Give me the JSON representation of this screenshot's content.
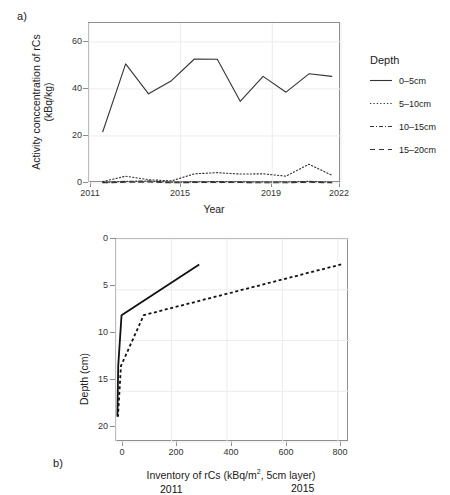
{
  "figure": {
    "background": "#ffffff",
    "line_color": "#333333",
    "grid_color": "#ececec",
    "frame_color": "#8d8d8d"
  },
  "panel_a": {
    "letter": "a)",
    "xlabel": "Year",
    "ylabel_line1": "Activity conccentration of rCs",
    "ylabel_line2": "(kBq/kg)",
    "xticks": [
      "2011",
      "2015",
      "2019",
      "2022"
    ],
    "yticks": [
      "0",
      "20",
      "40",
      "60"
    ],
    "legend": {
      "title": "Depth",
      "items": [
        {
          "label": "0–5cm",
          "style": "solid"
        },
        {
          "label": "5–10cm",
          "style": "dotted"
        },
        {
          "label": "10–15cm",
          "style": "dashdot"
        },
        {
          "label": "15–20cm",
          "style": "dashed"
        }
      ]
    }
  },
  "panel_b": {
    "letter": "b)",
    "xlabel_main": "Inventory of rCs (kBq/m",
    "xlabel_sup": "2",
    "xlabel_tail": ", 5cm layer)",
    "ylabel": "Depth (cm)",
    "xticks": [
      "0",
      "200",
      "400",
      "600",
      "800"
    ],
    "yticks": [
      "0",
      "5",
      "10",
      "15",
      "20"
    ],
    "annotations": [
      {
        "label": "2011"
      },
      {
        "label": "2015"
      }
    ]
  },
  "chart_data": [
    {
      "type": "line",
      "title": "",
      "panel": "a",
      "xlabel": "Year",
      "ylabel": "Activity conccentration of rCs (kBq/kg)",
      "xlim": [
        2011,
        2022
      ],
      "ylim": [
        0,
        68
      ],
      "xticks": [
        2011,
        2015,
        2019,
        2022
      ],
      "yticks": [
        0,
        20,
        40,
        60
      ],
      "grid": true,
      "legend_position": "right",
      "legend_title": "Depth",
      "x": [
        2011.6,
        2012.6,
        2013.6,
        2014.6,
        2015.6,
        2016.6,
        2017.6,
        2018.6,
        2019.6,
        2020.6,
        2021.6
      ],
      "series": [
        {
          "name": "0–5cm",
          "style": "solid",
          "values": [
            21.8,
            50.6,
            37.9,
            43.5,
            52.7,
            52.6,
            34.7,
            45.3,
            38.6,
            46.4,
            45.3
          ]
        },
        {
          "name": "5–10cm",
          "style": "dotted",
          "values": [
            0.6,
            2.9,
            1.4,
            0.9,
            3.9,
            4.4,
            3.8,
            3.9,
            2.9,
            8.0,
            3.3
          ]
        },
        {
          "name": "10–15cm",
          "style": "dashdot",
          "values": [
            0.2,
            0.7,
            0.9,
            0.3,
            0.5,
            0.6,
            0.5,
            0.4,
            0.4,
            0.7,
            0.3
          ]
        },
        {
          "name": "15–20cm",
          "style": "dashed",
          "values": [
            0.1,
            0.3,
            0.4,
            0.1,
            0.2,
            0.2,
            0.2,
            0.1,
            0.1,
            0.3,
            0.1
          ]
        }
      ]
    },
    {
      "type": "line",
      "title": "",
      "panel": "b",
      "xlabel": "Inventory of rCs (kBq/m2, 5cm layer)",
      "ylabel": "Depth (cm)",
      "xlim": [
        0,
        840
      ],
      "ylim": [
        0,
        20
      ],
      "y_inverted": true,
      "xticks": [
        0,
        200,
        400,
        600,
        800
      ],
      "yticks": [
        0,
        5,
        10,
        15,
        20
      ],
      "grid": true,
      "series": [
        {
          "name": "2011",
          "style": "solid",
          "x": [
            300,
            20,
            8,
            5
          ],
          "depth": [
            2.5,
            7.5,
            12.5,
            17.5
          ]
        },
        {
          "name": "2015",
          "style": "dotted",
          "x": [
            812,
            100,
            18,
            7
          ],
          "depth": [
            2.5,
            7.5,
            12.5,
            17.5
          ]
        }
      ]
    }
  ]
}
